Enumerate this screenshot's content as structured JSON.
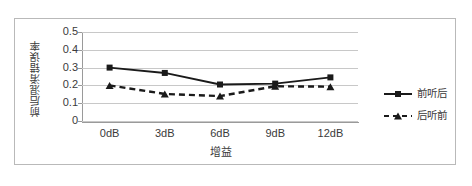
{
  "chart_data": {
    "type": "line",
    "title": "",
    "xlabel": "增益",
    "ylabel": "前后混淆错误率",
    "categories": [
      "0dB",
      "3dB",
      "6dB",
      "9dB",
      "12dB"
    ],
    "x_tick_labels": [
      "0dB",
      "3dB",
      "6dB",
      "9dB",
      "12dB"
    ],
    "y_tick_labels": [
      "0.5",
      "0.4",
      "0.3",
      "0.2",
      "0.1",
      "0"
    ],
    "y_tick_values": [
      0.5,
      0.4,
      0.3,
      0.2,
      0.1,
      0
    ],
    "ylim": [
      0,
      0.5
    ],
    "grid": "horizontal",
    "legend_position": "right",
    "series": [
      {
        "name": "前听后",
        "marker": "square",
        "linestyle": "solid",
        "color": "#1a1a1a",
        "values": [
          0.3,
          0.27,
          0.205,
          0.21,
          0.245
        ]
      },
      {
        "name": "后听前",
        "marker": "triangle",
        "linestyle": "dashed",
        "color": "#1a1a1a",
        "values": [
          0.2,
          0.152,
          0.14,
          0.195,
          0.193
        ]
      }
    ]
  },
  "colors": {
    "series": "#1a1a1a",
    "grid": "#c8c8c8",
    "axis": "#9a9a9a",
    "frame": "#b9b9b9",
    "text": "#3a3a3a",
    "background": "#ffffff"
  }
}
